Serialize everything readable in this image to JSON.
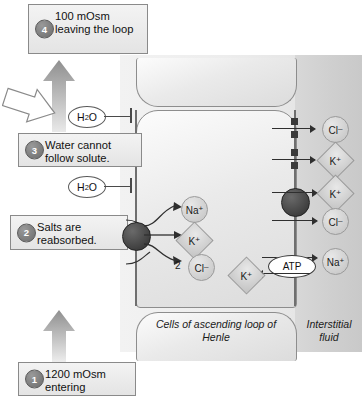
{
  "diagram": {
    "colors": {
      "cell_fill": "#eaeaea",
      "interstitial_fill": "#cfcfcf",
      "membrane": "#6f6f6f",
      "transporter": "#2e2e2e",
      "callout_border": "#8a8a8a",
      "badge": "#6b6b6b"
    }
  },
  "callouts": [
    {
      "number": "1",
      "text": "1200 mOsm entering"
    },
    {
      "number": "2",
      "text": "Salts are reabsorbed."
    },
    {
      "number": "3",
      "text": "Water cannot follow solute."
    },
    {
      "number": "4",
      "text": "100 mOsm leaving the loop"
    }
  ],
  "water": {
    "label_1": "H2O",
    "label_2": "H2O",
    "blocked": true
  },
  "ions": {
    "na_lumen": "Na",
    "k_lumen": "K",
    "cl_lumen": "Cl",
    "cl_lumen_count": "2",
    "cl_basal": "Cl",
    "k_basal": "K",
    "k_basal2": "K",
    "cl_basal2": "Cl",
    "na_atp": "Na",
    "k_atp": "K",
    "charge_plus": "+",
    "charge_minus": "–"
  },
  "pump": {
    "label": "ATP"
  },
  "regions": {
    "cells": "Cells of ascending loop of Henle",
    "interstitial": "Interstitial fluid"
  }
}
